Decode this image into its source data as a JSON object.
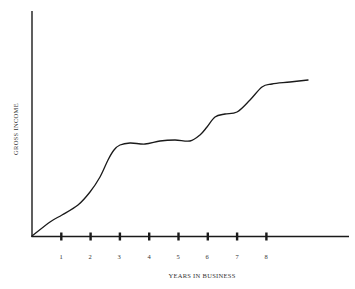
{
  "chart_data": {
    "type": "line",
    "title": "",
    "xlabel": "YEARS IN BUSINESS",
    "ylabel": "GROSS INCOME",
    "x_ticks": [
      "1",
      "2",
      "3",
      "4",
      "5",
      "6",
      "7",
      "8"
    ],
    "xlim": [
      0,
      9.6
    ],
    "ylim": [
      0,
      100
    ],
    "grid": false,
    "legend": null,
    "y_tick_labels": false,
    "series": [
      {
        "name": "Gross income",
        "x": [
          0,
          0.6,
          1.0,
          1.6,
          2.0,
          2.3,
          2.6,
          2.9,
          3.2,
          3.5,
          3.9,
          4.4,
          4.9,
          5.4,
          5.8,
          6.0,
          6.3,
          6.6,
          7.0,
          7.4,
          7.9,
          8.2,
          8.8,
          9.4
        ],
        "y": [
          0,
          6,
          9,
          14,
          20,
          27,
          37,
          46,
          51,
          52,
          52,
          53,
          53,
          53,
          56,
          47.5,
          53,
          54,
          55,
          60,
          66,
          67.5,
          68.5,
          69.5
        ]
      }
    ]
  },
  "axis": {
    "x_label": "YEARS IN BUSINESS",
    "y_label": "GROSS INCOME",
    "ticks": [
      "1",
      "2",
      "3",
      "4",
      "5",
      "6",
      "7",
      "8"
    ]
  },
  "colors": {
    "line": "#1a1a1a",
    "axis": "#1a1a1a",
    "background": "#ffffff"
  }
}
